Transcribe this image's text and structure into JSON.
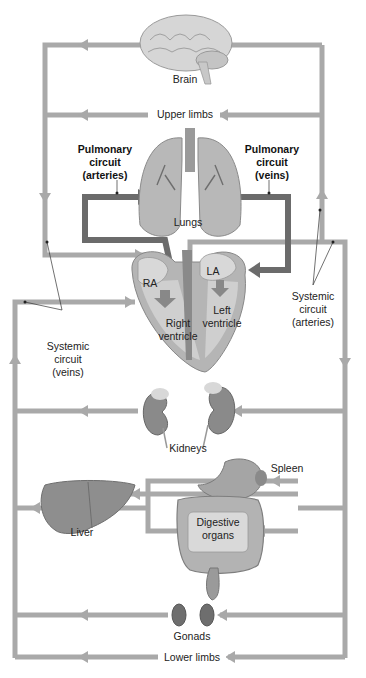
{
  "diagram": {
    "colors": {
      "systemic": "#a9a9a9",
      "pulmonary": "#6b6b6b",
      "organ": "#9a9a9a",
      "organ_dark": "#6e6e6e",
      "text": "#222222"
    },
    "labels": {
      "brain": "Brain",
      "upper_limbs": "Upper limbs",
      "pulm_arteries_l1": "Pulmonary",
      "pulm_arteries_l2": "circuit",
      "pulm_arteries_l3": "(arteries)",
      "pulm_veins_l1": "Pulmonary",
      "pulm_veins_l2": "circuit",
      "pulm_veins_l3": "(veins)",
      "lungs": "Lungs",
      "ra": "RA",
      "la": "LA",
      "right_ventricle_l1": "Right",
      "right_ventricle_l2": "ventricle",
      "left_ventricle_l1": "Left",
      "left_ventricle_l2": "ventricle",
      "sys_veins_l1": "Systemic",
      "sys_veins_l2": "circuit",
      "sys_veins_l3": "(veins)",
      "sys_arteries_l1": "Systemic",
      "sys_arteries_l2": "circuit",
      "sys_arteries_l3": "(arteries)",
      "kidneys": "Kidneys",
      "spleen": "Spleen",
      "liver": "Liver",
      "digestive_l1": "Digestive",
      "digestive_l2": "organs",
      "gonads": "Gonads",
      "lower_limbs": "Lower limbs"
    }
  }
}
